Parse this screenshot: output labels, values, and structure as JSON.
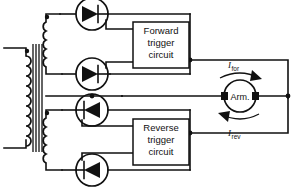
{
  "diagram": {
    "background": "#ffffff",
    "line_color": "#111111"
  },
  "blocks": {
    "forward_trigger": {
      "line1": "Forward",
      "line2": "trigger",
      "line3": "circuit"
    },
    "reverse_trigger": {
      "line1": "Reverse",
      "line2": "trigger",
      "line3": "circuit"
    }
  },
  "load": {
    "label": "Arm.",
    "name": "armature"
  },
  "currents": {
    "forward": {
      "symbol": "I",
      "subscript": "for",
      "direction": "right"
    },
    "reverse": {
      "symbol": "I",
      "subscript": "rev",
      "direction": "left"
    }
  },
  "devices": [
    {
      "id": "scr1",
      "type": "thyristor",
      "orientation": "right",
      "group": "forward"
    },
    {
      "id": "scr2",
      "type": "thyristor",
      "orientation": "right",
      "group": "forward"
    },
    {
      "id": "scr3",
      "type": "thyristor",
      "orientation": "left",
      "group": "reverse"
    },
    {
      "id": "scr4",
      "type": "thyristor",
      "orientation": "left",
      "group": "reverse"
    }
  ],
  "transformer": {
    "name": "supply-transformer",
    "primary_windings": 1,
    "secondary_windings": 2,
    "polarity_dots": 3
  }
}
